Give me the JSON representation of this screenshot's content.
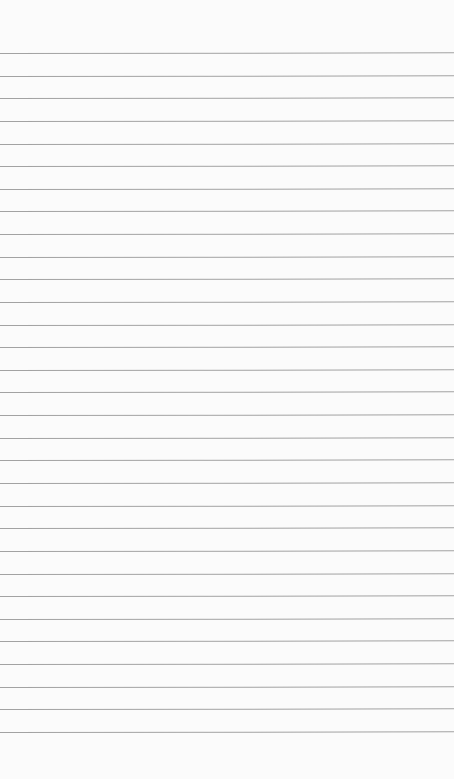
{
  "page": {
    "type": "blank-lined-paper",
    "background_color": "#fbfbfb",
    "line_color": "#a2a2a2",
    "line_count": 31,
    "first_line_y": 53,
    "line_spacing": 22.63
  }
}
